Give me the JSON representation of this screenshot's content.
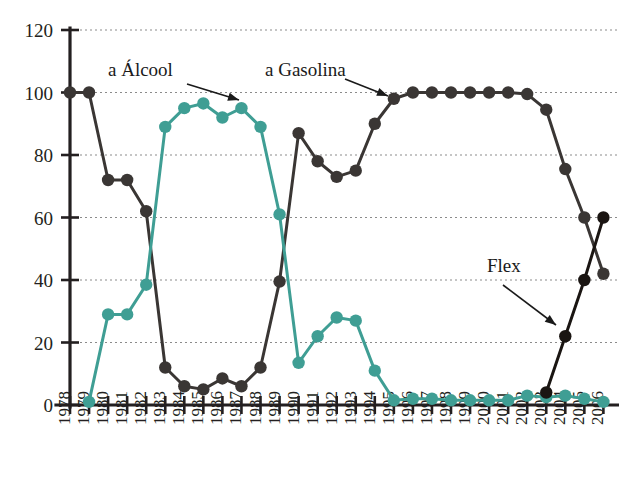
{
  "chart_data": {
    "type": "line",
    "title": "",
    "subtitle": "",
    "xlabel": "",
    "ylabel": "",
    "xlim": [
      1978,
      2006
    ],
    "ylim": [
      0,
      120
    ],
    "yticks": [
      0,
      20,
      40,
      60,
      80,
      100,
      120
    ],
    "grid": true,
    "grid_axis": "y",
    "legend_position": "inline-annotations",
    "categories": [
      "1978",
      "1979",
      "1980",
      "1981",
      "1982",
      "1983",
      "1984",
      "1985",
      "1986",
      "1987",
      "1988",
      "1989",
      "1990",
      "1991",
      "1992",
      "1993",
      "1994",
      "1995",
      "1996",
      "1997",
      "1998",
      "1999",
      "2000",
      "2001",
      "2002",
      "2003",
      "2004",
      "2005",
      "2006"
    ],
    "series": [
      {
        "name": "a Gasolina",
        "color": "#3a3634",
        "marker": "circle",
        "values": [
          100,
          100,
          72,
          72,
          62,
          12,
          6,
          5,
          8.5,
          6,
          12,
          39.5,
          87,
          78,
          73,
          75,
          90,
          98,
          100,
          100,
          100,
          100,
          100,
          100,
          99.5,
          94.5,
          75.5,
          60,
          42
        ]
      },
      {
        "name": "a Álcool",
        "color": "#3f9e94",
        "marker": "circle",
        "values": [
          null,
          1,
          29,
          29,
          38.5,
          89,
          95,
          96.5,
          92,
          95,
          89,
          61,
          13.5,
          22,
          28,
          27,
          11,
          1.5,
          2,
          2,
          1.5,
          1.5,
          1.5,
          1.5,
          3,
          2.5,
          3,
          2,
          1
        ]
      },
      {
        "name": "Flex",
        "color": "#1a1512",
        "marker": "circle",
        "values": [
          null,
          null,
          null,
          null,
          null,
          null,
          null,
          null,
          null,
          null,
          null,
          null,
          null,
          null,
          null,
          null,
          null,
          null,
          null,
          null,
          null,
          null,
          null,
          null,
          null,
          4,
          22,
          40,
          60
        ]
      }
    ],
    "annotations": [
      {
        "text": "a Álcool",
        "label_x": 108,
        "label_y": 76,
        "arrow_from_x": 187,
        "arrow_from_y": 84,
        "arrow_to_x": 239,
        "arrow_to_y": 100
      },
      {
        "text": "a Gasolina",
        "label_x": 265,
        "label_y": 76,
        "arrow_from_x": 345,
        "arrow_from_y": 79,
        "arrow_to_x": 388,
        "arrow_to_y": 96
      },
      {
        "text": "Flex",
        "label_x": 487,
        "label_y": 272,
        "arrow_from_x": 503,
        "arrow_from_y": 285,
        "arrow_to_x": 556,
        "arrow_to_y": 325
      }
    ]
  }
}
